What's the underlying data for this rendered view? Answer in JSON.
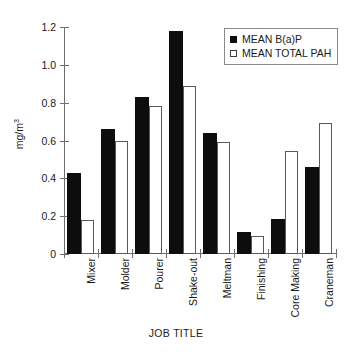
{
  "chart_data": {
    "type": "bar",
    "title": "",
    "xlabel": "JOB TITLE",
    "ylabel": "mg/m",
    "ylabel_exponent": "3",
    "ylabel_full": "mg/m³",
    "categories": [
      "Mixer",
      "Molder",
      "Pourer",
      "Shake-out",
      "Meltman",
      "Finishing",
      "Core Making",
      "Craneman"
    ],
    "series": [
      {
        "name": "MEAN B(a)P",
        "color": "#0d0d0d",
        "style": "filled",
        "values": [
          0.43,
          0.66,
          0.83,
          1.18,
          0.64,
          0.115,
          0.185,
          0.46
        ]
      },
      {
        "name": "MEAN TOTAL PAH",
        "color": "#ffffff",
        "style": "open",
        "values": [
          0.18,
          0.6,
          0.78,
          0.89,
          0.59,
          0.095,
          0.545,
          0.69
        ]
      }
    ],
    "ylim": [
      0,
      1.2
    ],
    "yticks": [
      0,
      0.2,
      0.4,
      0.6,
      0.8,
      1.0,
      1.2
    ],
    "ytick_labels": [
      "0",
      "0.2",
      "0.4",
      "0.6",
      "0.8",
      "1.0",
      "1.2"
    ],
    "grid": false,
    "legend_position": "top-right",
    "legend_entries": [
      "MEAN B(a)P",
      "MEAN TOTAL PAH"
    ]
  }
}
